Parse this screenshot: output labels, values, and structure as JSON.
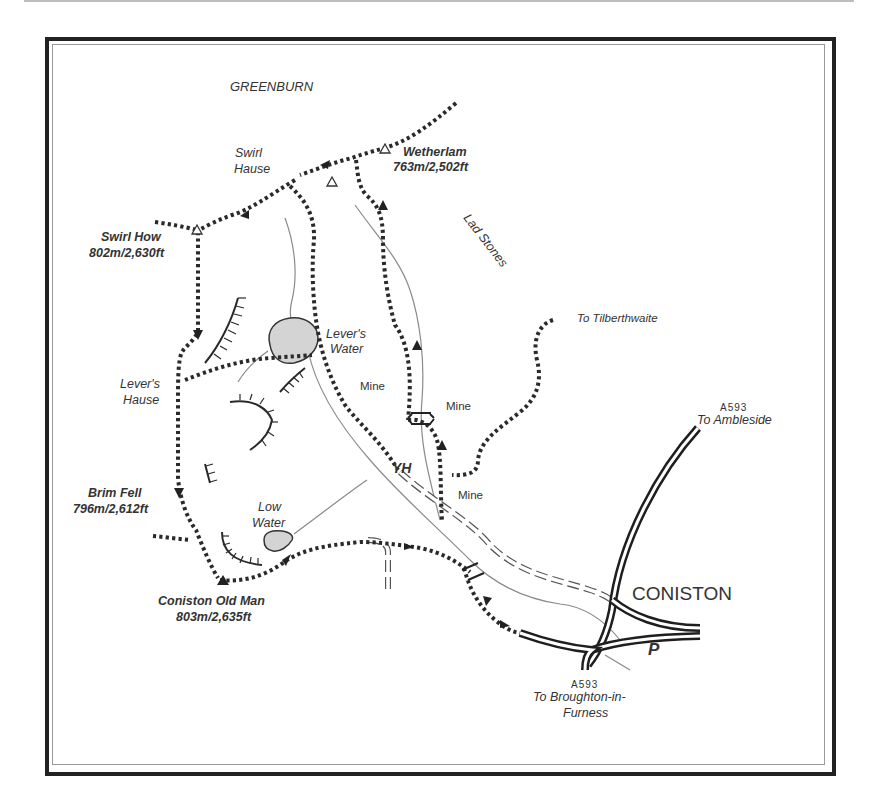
{
  "map": {
    "area_label": "GREENBURN",
    "summits": [
      {
        "name": "Wetherlam",
        "height": "763m/2,502ft"
      },
      {
        "name": "Swirl How",
        "height": "802m/2,630ft"
      },
      {
        "name": "Brim Fell",
        "height": "796m/2,612ft"
      },
      {
        "name": "Coniston Old Man",
        "height": "803m/2,635ft"
      }
    ],
    "places": {
      "swirl_hause_1": "Swirl",
      "swirl_hause_2": "Hause",
      "lad_stones": "Lad Stones",
      "levers_water_1": "Lever's",
      "levers_water_2": "Water",
      "levers_hause_1": "Lever's",
      "levers_hause_2": "Hause",
      "mine_1": "Mine",
      "mine_2": "Mine",
      "mine_3": "Mine",
      "youth_hostel": "YH",
      "low_water_1": "Low",
      "low_water_2": "Water",
      "town": "CONISTON",
      "parking": "P"
    },
    "roads": {
      "north_ref": "A593",
      "north_dest": "To Ambleside",
      "south_ref": "A593",
      "south_dest_1": "To Broughton-in-",
      "south_dest_2": "Furness",
      "path_dest": "To Tilberthwaite"
    },
    "colors": {
      "route": "#2a2a2a",
      "water": "#d4d4d4",
      "frame": "#222222",
      "stream": "#8a8a8a"
    }
  }
}
